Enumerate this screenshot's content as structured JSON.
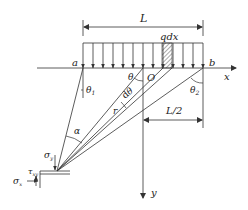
{
  "diagram": {
    "type": "elasticity-half-plane-distributed-load",
    "colors": {
      "stroke": "#333333",
      "text": "#222222",
      "hatch": "#555555",
      "background": "#ffffff"
    },
    "labels": {
      "length": "L",
      "load": "qdx",
      "point_a": "a",
      "point_b": "b",
      "origin": "O",
      "x_axis": "x",
      "y_axis": "y",
      "theta": "θ",
      "theta1": "θ",
      "theta1_sub": "1",
      "theta2": "θ",
      "theta2_sub": "2",
      "dtheta": "dθ",
      "radius": "r",
      "alpha": "α",
      "half_length": "L/2",
      "sigma_y": "σ",
      "sigma_y_sub": "y",
      "sigma_x": "σ",
      "sigma_x_sub": "x",
      "tau_xy": "τ",
      "tau_xy_sub": "xy"
    },
    "load": {
      "arrow_count": 13,
      "hatched_strip": "qdx"
    }
  }
}
